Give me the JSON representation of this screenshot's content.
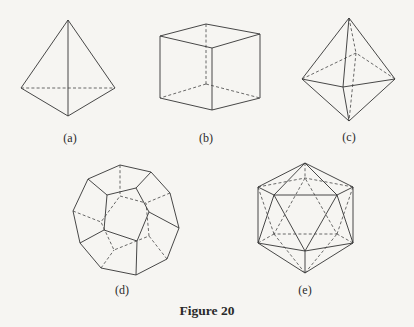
{
  "figure": {
    "caption": "Figure 20",
    "panels": [
      {
        "id": "a",
        "label": "(a)",
        "shape": "tetrahedron"
      },
      {
        "id": "b",
        "label": "(b)",
        "shape": "cube"
      },
      {
        "id": "c",
        "label": "(c)",
        "shape": "octahedron"
      },
      {
        "id": "d",
        "label": "(d)",
        "shape": "dodecahedron"
      },
      {
        "id": "e",
        "label": "(e)",
        "shape": "icosahedron"
      }
    ]
  },
  "colors": {
    "background": "#f6f5f2",
    "line": "#333333"
  }
}
